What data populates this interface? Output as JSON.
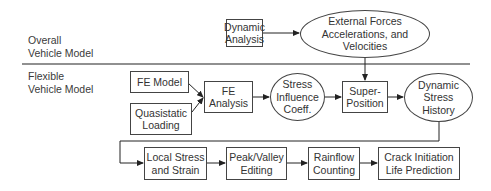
{
  "sections": {
    "overall": "Overall\nVehicle Model",
    "flexible": "Flexible\nVehicle Model"
  },
  "nodes": {
    "dynamic_analysis": "Dynamic\nAnalysis",
    "external_forces": "External Forces\nAccelerations, and\nVelocities",
    "fe_model": "FE Model",
    "quasistatic_loading": "Quasistatic\nLoading",
    "fe_analysis": "FE\nAnalysis",
    "stress_influence": "Stress\nInfluence\nCoeff.",
    "superposition": "Super-\nPosition",
    "dynamic_stress_history": "Dynamic\nStress\nHistory",
    "local_stress_strain": "Local Stress\nand Strain",
    "peak_valley": "Peak/Valley\nEditing",
    "rainflow": "Rainflow\nCounting",
    "crack_initiation": "Crack Initiation\nLife Prediction"
  },
  "edges": [
    {
      "from": "dynamic_analysis",
      "to": "external_forces"
    },
    {
      "from": "external_forces",
      "to": "superposition"
    },
    {
      "from": "fe_model",
      "to": "fe_analysis"
    },
    {
      "from": "quasistatic_loading",
      "to": "fe_analysis"
    },
    {
      "from": "fe_analysis",
      "to": "stress_influence"
    },
    {
      "from": "stress_influence",
      "to": "superposition"
    },
    {
      "from": "superposition",
      "to": "dynamic_stress_history"
    },
    {
      "from": "dynamic_stress_history",
      "to": "local_stress_strain"
    },
    {
      "from": "local_stress_strain",
      "to": "peak_valley"
    },
    {
      "from": "peak_valley",
      "to": "rainflow"
    },
    {
      "from": "rainflow",
      "to": "crack_initiation"
    }
  ],
  "colors": {
    "line": "#333333",
    "text": "#333333",
    "background": "#ffffff"
  }
}
